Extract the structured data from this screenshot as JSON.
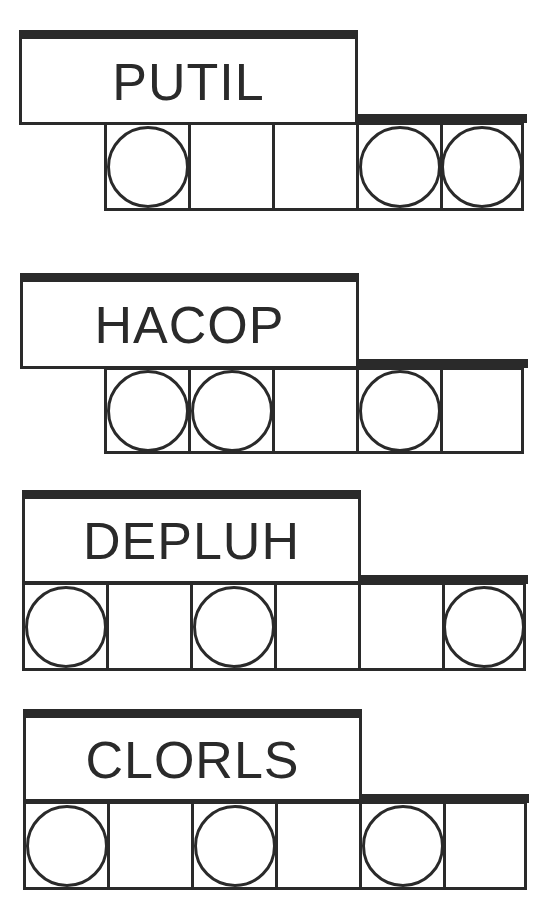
{
  "game": {
    "type": "word-jumble",
    "ink_color": "#2a2a2a",
    "background_color": "#ffffff",
    "puzzles": [
      {
        "scrambled": "PUTIL",
        "cell_count": 5,
        "circled_positions": [
          1,
          4,
          5
        ],
        "answer_cells": [
          "",
          "",
          "",
          "",
          ""
        ]
      },
      {
        "scrambled": "HACOP",
        "cell_count": 5,
        "circled_positions": [
          1,
          2,
          4
        ],
        "answer_cells": [
          "",
          "",
          "",
          "",
          ""
        ]
      },
      {
        "scrambled": "DEPLUH",
        "cell_count": 6,
        "circled_positions": [
          1,
          3,
          6
        ],
        "answer_cells": [
          "",
          "",
          "",
          "",
          "",
          ""
        ]
      },
      {
        "scrambled": "CLORLS",
        "cell_count": 6,
        "circled_positions": [
          1,
          3,
          5
        ],
        "answer_cells": [
          "",
          "",
          "",
          "",
          "",
          ""
        ]
      }
    ]
  }
}
